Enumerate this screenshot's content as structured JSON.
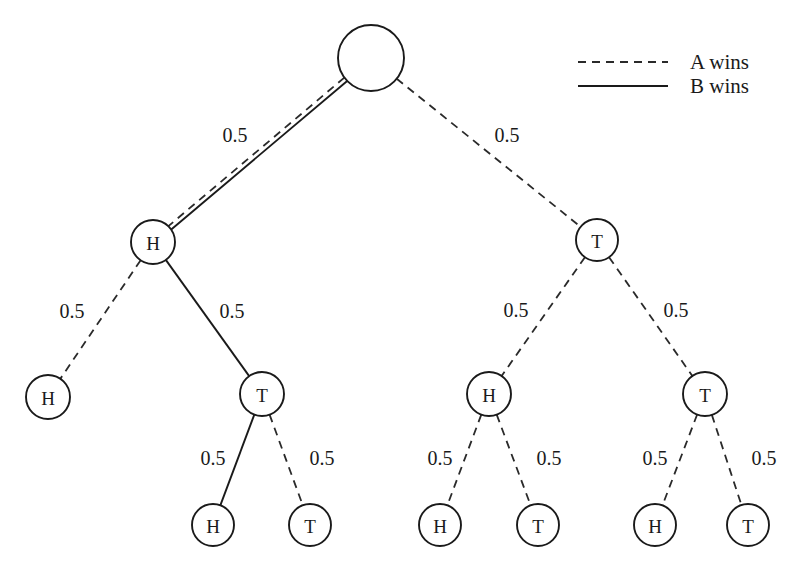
{
  "figure": {
    "type": "probability-game-tree",
    "background": "#ffffff",
    "line_color": "#1a1a1a",
    "width": 798,
    "height": 570
  },
  "legend": {
    "entries": [
      {
        "id": "a-wins",
        "style": "dashed",
        "label": "A wins"
      },
      {
        "id": "b-wins",
        "style": "solid",
        "label": "B wins"
      }
    ],
    "sample_x1": 578,
    "sample_x2": 668,
    "text_x": 690,
    "row_y": [
      62,
      86
    ]
  },
  "nodes": [
    {
      "id": "root",
      "label": "",
      "cx": 371,
      "cy": 58,
      "r": 33
    },
    {
      "id": "n-h",
      "label": "H",
      "cx": 153,
      "cy": 242,
      "r": 22
    },
    {
      "id": "n-t",
      "label": "T",
      "cx": 597,
      "cy": 240,
      "r": 21
    },
    {
      "id": "n-hh",
      "label": "H",
      "cx": 48,
      "cy": 397,
      "r": 22
    },
    {
      "id": "n-ht",
      "label": "T",
      "cx": 262,
      "cy": 394,
      "r": 22
    },
    {
      "id": "n-th",
      "label": "H",
      "cx": 489,
      "cy": 394,
      "r": 22
    },
    {
      "id": "n-tt",
      "label": "T",
      "cx": 705,
      "cy": 394,
      "r": 22
    },
    {
      "id": "n-hth",
      "label": "H",
      "cx": 213,
      "cy": 525,
      "r": 21
    },
    {
      "id": "n-htt",
      "label": "T",
      "cx": 310,
      "cy": 525,
      "r": 21
    },
    {
      "id": "n-thh",
      "label": "H",
      "cx": 440,
      "cy": 525,
      "r": 21
    },
    {
      "id": "n-tht",
      "label": "T",
      "cx": 538,
      "cy": 525,
      "r": 21
    },
    {
      "id": "n-tth",
      "label": "H",
      "cx": 655,
      "cy": 525,
      "r": 21
    },
    {
      "id": "n-ttt",
      "label": "T",
      "cx": 748,
      "cy": 525,
      "r": 21
    }
  ],
  "edges": [
    {
      "id": "e-root-h",
      "from": "root",
      "to": "n-h",
      "style": "double",
      "label": "0.5",
      "lx": 235,
      "ly": 135
    },
    {
      "id": "e-root-t",
      "from": "root",
      "to": "n-t",
      "style": "dashed",
      "label": "0.5",
      "lx": 507,
      "ly": 135
    },
    {
      "id": "e-h-hh",
      "from": "n-h",
      "to": "n-hh",
      "style": "dashed",
      "label": "0.5",
      "lx": 72,
      "ly": 311
    },
    {
      "id": "e-h-ht",
      "from": "n-h",
      "to": "n-ht",
      "style": "solid",
      "label": "0.5",
      "lx": 232,
      "ly": 311
    },
    {
      "id": "e-t-th",
      "from": "n-t",
      "to": "n-th",
      "style": "dashed",
      "label": "0.5",
      "lx": 516,
      "ly": 310
    },
    {
      "id": "e-t-tt",
      "from": "n-t",
      "to": "n-tt",
      "style": "dashed",
      "label": "0.5",
      "lx": 676,
      "ly": 310
    },
    {
      "id": "e-ht-hth",
      "from": "n-ht",
      "to": "n-hth",
      "style": "solid",
      "label": "0.5",
      "lx": 213,
      "ly": 458
    },
    {
      "id": "e-ht-htt",
      "from": "n-ht",
      "to": "n-htt",
      "style": "dashed",
      "label": "0.5",
      "lx": 322,
      "ly": 458
    },
    {
      "id": "e-th-thh",
      "from": "n-th",
      "to": "n-thh",
      "style": "dashed",
      "label": "0.5",
      "lx": 440,
      "ly": 458
    },
    {
      "id": "e-th-tht",
      "from": "n-th",
      "to": "n-tht",
      "style": "dashed",
      "label": "0.5",
      "lx": 549,
      "ly": 458
    },
    {
      "id": "e-tt-tth",
      "from": "n-tt",
      "to": "n-tth",
      "style": "dashed",
      "label": "0.5",
      "lx": 655,
      "ly": 458
    },
    {
      "id": "e-tt-ttt",
      "from": "n-tt",
      "to": "n-ttt",
      "style": "dashed",
      "label": "0.5",
      "lx": 764,
      "ly": 458
    }
  ]
}
